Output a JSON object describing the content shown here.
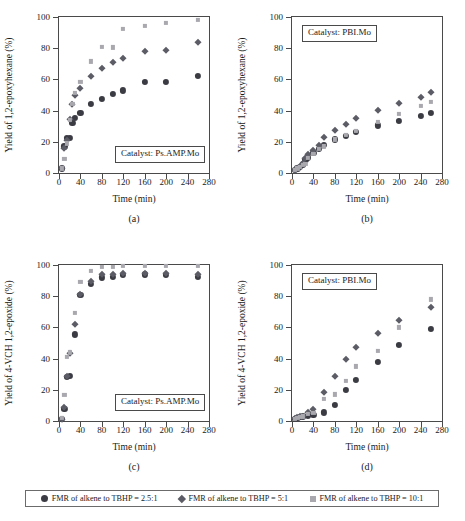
{
  "figure": {
    "legend_items": [
      {
        "marker": "filled-circle",
        "label": "FMR of alkene to TBHP = 2.5:1",
        "color": "#3b3b44"
      },
      {
        "marker": "filled-diamond",
        "label": "FMR of alkene to TBHP = 5:1",
        "color": "#5c5c66"
      },
      {
        "marker": "filled-square",
        "label": "FMR of alkene to TBHP = 10:1",
        "color": "#a8a8ae"
      }
    ]
  },
  "chart_data": [
    {
      "id": "a",
      "type": "scatter",
      "panel_label": "(a)",
      "annotation": "Catalyst: Ps.AMP.Mo",
      "title": "",
      "xlabel": "Time (min)",
      "ylabel": "Yield of 1,2-epoxyhexane (%)",
      "xlim": [
        0,
        280
      ],
      "ylim": [
        0,
        100
      ],
      "xticks": [
        0,
        40,
        80,
        120,
        160,
        200,
        240,
        280
      ],
      "yticks": [
        0,
        20,
        40,
        60,
        80,
        100
      ],
      "grid": false,
      "legend_position": "figure-bottom",
      "series": [
        {
          "name": "FMR of alkene to TBHP = 2.5:1",
          "x": [
            5,
            10,
            15,
            20,
            25,
            30,
            40,
            60,
            80,
            100,
            120,
            160,
            200,
            260
          ],
          "y": [
            3,
            17,
            22.5,
            22.5,
            32,
            35.5,
            38.5,
            44.5,
            47.5,
            50.5,
            53,
            58.5,
            58.5,
            62
          ]
        },
        {
          "name": "FMR of alkene to TBHP = 5:1",
          "x": [
            5,
            10,
            15,
            20,
            25,
            30,
            40,
            60,
            80,
            100,
            120,
            160,
            200,
            260
          ],
          "y": [
            3,
            16,
            21,
            34.5,
            44.5,
            50,
            54.5,
            62,
            67.5,
            71,
            74,
            78.5,
            79,
            84
          ]
        },
        {
          "name": "FMR of alkene to TBHP = 10:1",
          "x": [
            5,
            10,
            15,
            20,
            25,
            30,
            40,
            60,
            80,
            100,
            120,
            160,
            200,
            260
          ],
          "y": [
            3,
            9,
            19,
            34,
            44.5,
            51.5,
            58.5,
            71.5,
            81,
            80.5,
            92.5,
            94.5,
            96,
            98
          ]
        }
      ]
    },
    {
      "id": "b",
      "type": "scatter",
      "panel_label": "(b)",
      "annotation": "Catalyst: PBI.Mo",
      "title": "",
      "xlabel": "Time (min)",
      "ylabel": "Yield of 1,2-epoxyhexane (%)",
      "xlim": [
        0,
        280
      ],
      "ylim": [
        0,
        100
      ],
      "xticks": [
        0,
        40,
        80,
        120,
        160,
        200,
        240,
        280
      ],
      "yticks": [
        0,
        20,
        40,
        60,
        80,
        100
      ],
      "grid": false,
      "legend_position": "figure-bottom",
      "series": [
        {
          "name": "FMR of alkene to TBHP = 2.5:1",
          "x": [
            5,
            10,
            15,
            20,
            25,
            30,
            40,
            50,
            60,
            80,
            100,
            120,
            160,
            200,
            240,
            260
          ],
          "y": [
            2,
            3,
            4,
            5.5,
            8.5,
            10,
            13,
            15.5,
            18,
            21.5,
            24,
            26.5,
            30.5,
            33.5,
            36.5,
            38.5
          ]
        },
        {
          "name": "FMR of alkene to TBHP = 5:1",
          "x": [
            5,
            10,
            15,
            20,
            25,
            30,
            40,
            50,
            60,
            80,
            100,
            120,
            160,
            200,
            240,
            260
          ],
          "y": [
            2,
            3.5,
            4.5,
            6.5,
            9.5,
            12,
            15,
            18,
            23,
            27.5,
            31.5,
            35,
            40.5,
            45,
            48.5,
            52
          ]
        },
        {
          "name": "FMR of alkene to TBHP = 10:1",
          "x": [
            5,
            10,
            15,
            20,
            25,
            30,
            40,
            50,
            60,
            80,
            100,
            120,
            160,
            200,
            240,
            260
          ],
          "y": [
            2,
            3,
            4,
            5,
            6,
            9.5,
            12,
            15.5,
            17,
            21.5,
            24.5,
            27,
            32.5,
            38,
            43,
            45.5
          ]
        }
      ]
    },
    {
      "id": "c",
      "type": "scatter",
      "panel_label": "(c)",
      "annotation": "Catalyst: Ps.AMP.Mo",
      "title": "",
      "xlabel": "Time (min)",
      "ylabel": "Yield of 4-VCH 1,2-epoxide (%)",
      "xlim": [
        0,
        280
      ],
      "ylim": [
        0,
        100
      ],
      "xticks": [
        0,
        40,
        80,
        120,
        160,
        200,
        240,
        280
      ],
      "yticks": [
        0,
        20,
        40,
        60,
        80,
        100
      ],
      "grid": false,
      "legend_position": "figure-bottom",
      "series": [
        {
          "name": "FMR of alkene to TBHP = 2.5:1",
          "x": [
            5,
            10,
            15,
            20,
            30,
            40,
            60,
            80,
            100,
            120,
            160,
            200,
            260
          ],
          "y": [
            1.5,
            8,
            28.5,
            29,
            55.5,
            81,
            88,
            92,
            92.5,
            93.5,
            94,
            93.5,
            92.5
          ]
        },
        {
          "name": "FMR of alkene to TBHP = 5:1",
          "x": [
            5,
            10,
            15,
            20,
            30,
            40,
            60,
            80,
            100,
            120,
            160,
            200,
            260
          ],
          "y": [
            1.5,
            9,
            29,
            43.5,
            62,
            81.5,
            89.5,
            94.5,
            94,
            95,
            95,
            95,
            94.5
          ]
        },
        {
          "name": "FMR of alkene to TBHP = 10:1",
          "x": [
            5,
            10,
            15,
            20,
            30,
            40,
            60,
            80,
            100,
            120,
            160,
            200,
            260
          ],
          "y": [
            2,
            16.5,
            41,
            44,
            69.5,
            89,
            96,
            99,
            99,
            99.5,
            99.5,
            99.5,
            99.5
          ]
        }
      ]
    },
    {
      "id": "d",
      "type": "scatter",
      "panel_label": "(d)",
      "annotation": "Catalyst: PBI.Mo",
      "title": "",
      "xlabel": "Time (min)",
      "ylabel": "Yield of 4-VCH 1,2-epoxide (%)",
      "xlim": [
        0,
        280
      ],
      "ylim": [
        0,
        100
      ],
      "xticks": [
        0,
        40,
        80,
        120,
        160,
        200,
        240,
        280
      ],
      "yticks": [
        0,
        20,
        40,
        60,
        80,
        100
      ],
      "grid": false,
      "legend_position": "figure-bottom",
      "series": [
        {
          "name": "FMR of alkene to TBHP = 2.5:1",
          "x": [
            5,
            10,
            15,
            20,
            30,
            40,
            60,
            80,
            100,
            120,
            160,
            200,
            260
          ],
          "y": [
            1.5,
            2,
            2.5,
            3,
            3.5,
            4,
            5.5,
            10.5,
            20,
            26.5,
            38,
            49,
            59
          ]
        },
        {
          "name": "FMR of alkene to TBHP = 5:1",
          "x": [
            5,
            10,
            15,
            20,
            30,
            40,
            60,
            80,
            100,
            120,
            160,
            200,
            260
          ],
          "y": [
            2,
            2.5,
            3,
            3.5,
            5.5,
            7.5,
            18.5,
            29,
            39.5,
            47.5,
            56.5,
            65,
            73
          ]
        },
        {
          "name": "FMR of alkene to TBHP = 10:1",
          "x": [
            5,
            10,
            15,
            20,
            30,
            40,
            60,
            80,
            100,
            120,
            160,
            200,
            260
          ],
          "y": [
            1.5,
            2,
            2.5,
            3,
            4.5,
            5,
            14,
            17,
            25.5,
            35,
            45,
            60,
            78
          ]
        }
      ]
    }
  ]
}
